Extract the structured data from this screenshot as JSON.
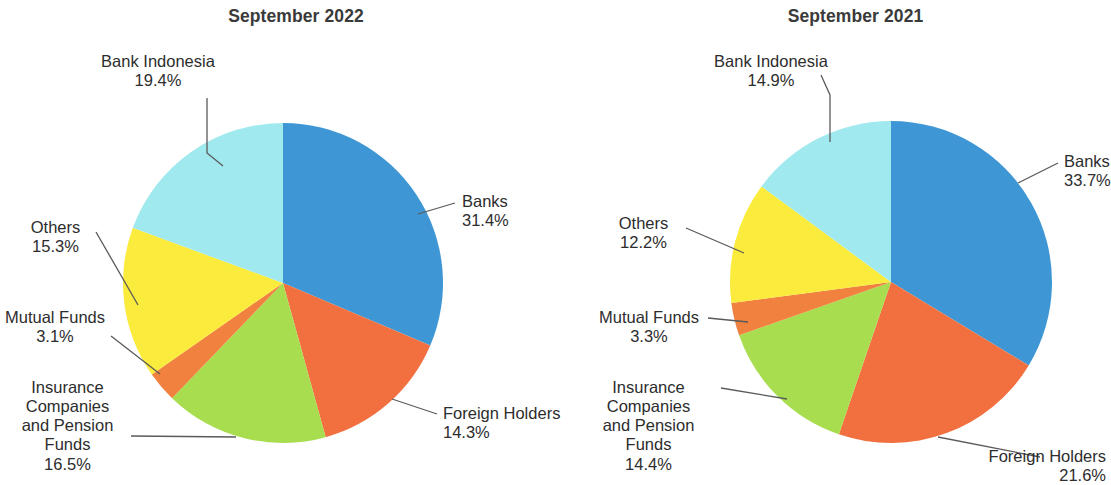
{
  "figure": {
    "background": "#ffffff",
    "panels": [
      "september_2022",
      "september_2021"
    ]
  },
  "palette": {
    "banks": "#3e97d4",
    "foreign_holders": "#f2703f",
    "insurance_companies_and_pension_funds": "#a8dd4f",
    "mutual_funds": "#f0813f",
    "others": "#fbeb3c",
    "bank_indonesia": "#9fe9ef",
    "leader_line": "#5a5a5a",
    "text": "#2d2d2d",
    "title_text": "#3a3a3a"
  },
  "left": {
    "title": "September 2022",
    "labels": {
      "banks": {
        "name": "Banks",
        "pct": "31.4%"
      },
      "foreign_holders": {
        "name": "Foreign Holders",
        "pct": "14.3%"
      },
      "insurance": {
        "line1": "Insurance",
        "line2": "Companies",
        "line3": "and Pension",
        "line4": "Funds",
        "pct": "16.5%"
      },
      "mutual_funds": {
        "name": "Mutual Funds",
        "pct": "3.1%"
      },
      "others": {
        "name": "Others",
        "pct": "15.3%"
      },
      "bank_indonesia": {
        "name": "Bank Indonesia",
        "pct": "19.4%"
      }
    }
  },
  "right": {
    "title": "September 2021",
    "labels": {
      "banks": {
        "name": "Banks",
        "pct": "33.7%"
      },
      "foreign_holders": {
        "name": "Foreign Holders",
        "pct": "21.6%"
      },
      "insurance": {
        "line1": "Insurance",
        "line2": "Companies",
        "line3": "and Pension",
        "line4": "Funds",
        "pct": "14.4%"
      },
      "mutual_funds": {
        "name": "Mutual Funds",
        "pct": "3.3%"
      },
      "others": {
        "name": "Others",
        "pct": "12.2%"
      },
      "bank_indonesia": {
        "name": "Bank Indonesia",
        "pct": "14.9%"
      }
    }
  },
  "chart_data": [
    {
      "type": "pie",
      "title": "September 2022",
      "legend": "labels-with-leader-lines",
      "start_angle_deg": 0,
      "direction": "clockwise",
      "categories": [
        "Banks",
        "Foreign Holders",
        "Insurance Companies and Pension Funds",
        "Mutual Funds",
        "Others",
        "Bank Indonesia"
      ],
      "values": [
        31.4,
        14.3,
        16.5,
        3.1,
        15.3,
        19.4
      ],
      "value_labels": [
        "31.4%",
        "14.3%",
        "16.5%",
        "3.1%",
        "15.3%",
        "19.4%"
      ],
      "unit": "percent",
      "total": 100.0,
      "colors": [
        "#3e97d4",
        "#f2703f",
        "#a8dd4f",
        "#f0813f",
        "#fbeb3c",
        "#9fe9ef"
      ]
    },
    {
      "type": "pie",
      "title": "September 2021",
      "legend": "labels-with-leader-lines",
      "start_angle_deg": 0,
      "direction": "clockwise",
      "categories": [
        "Banks",
        "Foreign Holders",
        "Insurance Companies and Pension Funds",
        "Mutual Funds",
        "Others",
        "Bank Indonesia"
      ],
      "values": [
        33.7,
        21.6,
        14.4,
        3.3,
        12.2,
        14.9
      ],
      "value_labels": [
        "33.7%",
        "21.6%",
        "14.4%",
        "3.3%",
        "12.2%",
        "14.9%"
      ],
      "unit": "percent",
      "total": 100.1,
      "colors": [
        "#3e97d4",
        "#f2703f",
        "#a8dd4f",
        "#f0813f",
        "#fbeb3c",
        "#9fe9ef"
      ]
    }
  ]
}
